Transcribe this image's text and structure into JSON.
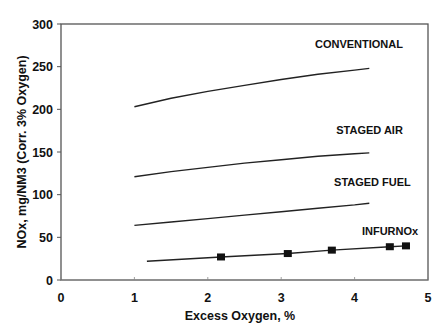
{
  "chart_data": {
    "type": "line",
    "title": "",
    "xlabel": "Excess Oxygen, %",
    "ylabel": "NOx, mg/NM3 (Corr. 3% Oxygen)",
    "xlim": [
      0,
      5
    ],
    "ylim": [
      0,
      300
    ],
    "xticks": [
      "0",
      "1",
      "2",
      "3",
      "4",
      "5"
    ],
    "yticks": [
      "0",
      "50",
      "100",
      "150",
      "200",
      "250",
      "300"
    ],
    "grid": false,
    "legend": "inline labels near line ends",
    "series": [
      {
        "name": "CONVENTIONAL",
        "marker": "none",
        "x": [
          1.0,
          1.5,
          2.0,
          2.5,
          3.0,
          3.5,
          4.0,
          4.2
        ],
        "y": [
          203,
          213,
          221,
          228,
          235,
          241,
          246,
          248
        ]
      },
      {
        "name": "STAGED AIR",
        "marker": "none",
        "x": [
          1.0,
          1.5,
          2.0,
          2.5,
          3.0,
          3.5,
          4.0,
          4.2
        ],
        "y": [
          121,
          127,
          132,
          137,
          141,
          145,
          148,
          149
        ]
      },
      {
        "name": "STAGED FUEL",
        "marker": "none",
        "x": [
          1.0,
          1.5,
          2.0,
          2.5,
          3.0,
          3.5,
          4.0,
          4.2
        ],
        "y": [
          64,
          68,
          72,
          76,
          80,
          84,
          88,
          90
        ]
      },
      {
        "name": "INFURNOx",
        "marker": "square",
        "x": [
          1.17,
          2.18,
          3.09,
          3.69,
          4.48,
          4.7
        ],
        "y": [
          22,
          27,
          31,
          35,
          39,
          40
        ],
        "marker_points": [
          {
            "x": 2.18,
            "y": 27
          },
          {
            "x": 3.09,
            "y": 31
          },
          {
            "x": 3.69,
            "y": 35
          },
          {
            "x": 4.48,
            "y": 39
          },
          {
            "x": 4.7,
            "y": 40
          }
        ]
      }
    ],
    "label_positions": {
      "CONVENTIONAL": {
        "x": 3.46,
        "y": 272
      },
      "STAGED AIR": {
        "x": 3.75,
        "y": 171
      },
      "STAGED FUEL": {
        "x": 3.72,
        "y": 110
      },
      "INFURNOx": {
        "x": 4.1,
        "y": 53
      }
    }
  },
  "caption": "FIGURE ..."
}
